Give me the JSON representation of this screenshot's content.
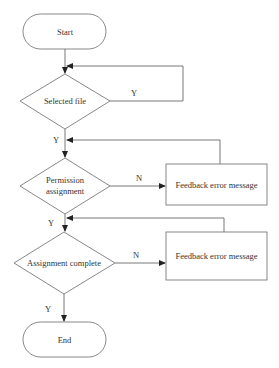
{
  "diagram": {
    "type": "flowchart",
    "nodes": {
      "start": {
        "label": "Start",
        "shape": "terminator"
      },
      "selected_file": {
        "label": "Selected file",
        "shape": "decision"
      },
      "permission": {
        "label_line1": "Permission",
        "label_line2": "assignment",
        "shape": "decision"
      },
      "feedback1": {
        "label": "Feedback error message",
        "shape": "process"
      },
      "assign_complete": {
        "label": "Assignment complete",
        "shape": "decision"
      },
      "feedback2": {
        "label": "Feedback error message",
        "shape": "process"
      },
      "end": {
        "label": "End",
        "shape": "terminator"
      }
    },
    "edges": {
      "selected_loop": "Y",
      "selected_to_permission": "Y",
      "permission_to_feedback": "N",
      "permission_to_complete": "Y",
      "complete_to_feedback": "N",
      "complete_to_end": "Y"
    },
    "colors": {
      "stroke": "#7a7a7a",
      "text": "#333333",
      "background": "#ffffff"
    }
  }
}
